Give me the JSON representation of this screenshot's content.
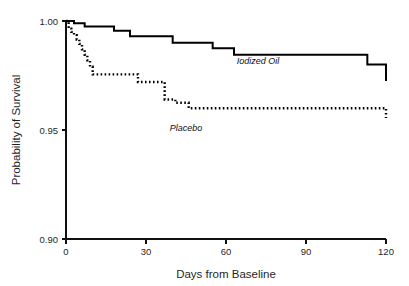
{
  "chart_data": {
    "type": "line",
    "title": "",
    "xlabel": "Days from Baseline",
    "ylabel": "Probability of Survival",
    "xlim": [
      0,
      120
    ],
    "ylim": [
      0.9,
      1.0
    ],
    "xticks": [
      0,
      30,
      60,
      90,
      120
    ],
    "xtick_labels": [
      "0",
      "30",
      "60",
      "90",
      "120"
    ],
    "yticks": [
      0.9,
      0.95,
      1.0
    ],
    "ytick_labels": [
      "0.90",
      "0.95",
      "1.00"
    ],
    "grid": false,
    "legend_position": "inline-annotation",
    "step_style": "post",
    "series": [
      {
        "name": "Iodized Oil",
        "style": "solid",
        "label_x": 72,
        "label_y": 0.9805,
        "x": [
          0,
          3,
          7,
          18,
          24,
          40,
          55,
          63,
          113,
          120
        ],
        "y": [
          1.0,
          0.999,
          0.9975,
          0.9955,
          0.993,
          0.99,
          0.9875,
          0.9845,
          0.98,
          0.9725
        ]
      },
      {
        "name": "Placebo",
        "style": "dotted",
        "label_x": 45,
        "label_y": 0.9495,
        "x": [
          0,
          1,
          2,
          3,
          4,
          5,
          6,
          7,
          8,
          9,
          10,
          27,
          30,
          37,
          41,
          46,
          120
        ],
        "y": [
          1.0,
          0.9965,
          0.995,
          0.9935,
          0.9915,
          0.9895,
          0.987,
          0.9845,
          0.982,
          0.979,
          0.9755,
          0.972,
          0.972,
          0.964,
          0.9625,
          0.96,
          0.9555
        ]
      }
    ]
  },
  "plot": {
    "geometry": {
      "x_px_min": 66,
      "x_px_max": 386,
      "y_px_top": 21,
      "y_px_bottom": 239
    }
  }
}
